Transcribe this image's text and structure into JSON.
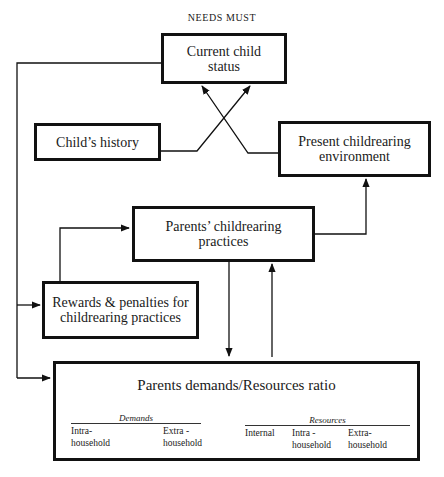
{
  "diagram": {
    "header": "NEEDS MUST",
    "nodes": {
      "current_child_status": {
        "label": "Current child\nstatus",
        "line1": "Current child",
        "line2": "status"
      },
      "childs_history": {
        "label": "Child’s history"
      },
      "present_env": {
        "label": "Present childrearing\nenvironment",
        "line1": "Present childrearing",
        "line2": "environment"
      },
      "parents_practices": {
        "label": "Parents’ childrearing\npractices",
        "line1": "Parents’ childrearing",
        "line2": "practices"
      },
      "rewards": {
        "label": "Rewards & penalties for\nchildrearing practices",
        "line1": "Rewards & penalties for",
        "line2": "childrearing practices"
      },
      "ratio": {
        "title": "Parents demands/Resources ratio",
        "demands": {
          "heading": "Demands",
          "columns": [
            "Intra-\nhousehold",
            "Extra -\nhousehold"
          ]
        },
        "resources": {
          "heading": "Resources",
          "columns": [
            "Internal",
            "Intra -\nhousehold",
            "Extra-\nhousehold"
          ]
        }
      }
    },
    "edges": [
      {
        "from": "childs_history",
        "to": "current_child_status"
      },
      {
        "from": "present_env",
        "to": "current_child_status"
      },
      {
        "from": "current_child_status",
        "to": "rewards"
      },
      {
        "from": "current_child_status",
        "to": "ratio"
      },
      {
        "from": "rewards",
        "to": "parents_practices"
      },
      {
        "from": "parents_practices",
        "to": "present_env"
      },
      {
        "from": "parents_practices",
        "to": "ratio"
      },
      {
        "from": "ratio",
        "to": "parents_practices"
      }
    ],
    "colors": {
      "line": "#111111",
      "background": "#ffffff"
    }
  }
}
